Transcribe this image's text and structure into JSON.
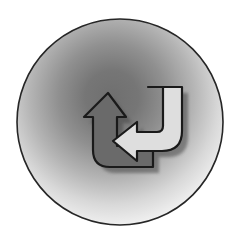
{
  "image": {
    "title": "Refresh / Swap Cycle Icon",
    "description": "A grayscale circular badge with a radial gradient background containing a two-arrow cyclical swap symbol.",
    "width": 242,
    "height": 246,
    "background_color": "#ffffff"
  },
  "badge": {
    "name": "circular-badge",
    "shape": "circle",
    "center_x": 120,
    "center_y": 122,
    "radius": 103,
    "outline_color": "#262626",
    "outline_width": 1.6,
    "gradient": {
      "type": "radial",
      "center_x_pct": 46,
      "center_y_pct": 38,
      "stops": [
        {
          "offset": "0%",
          "color": "#6f6f6f"
        },
        {
          "offset": "18%",
          "color": "#767676"
        },
        {
          "offset": "36%",
          "color": "#909090"
        },
        {
          "offset": "55%",
          "color": "#b4b4b4"
        },
        {
          "offset": "72%",
          "color": "#d8d8d8"
        },
        {
          "offset": "86%",
          "color": "#efefef"
        },
        {
          "offset": "100%",
          "color": "#fdfdfd"
        }
      ]
    }
  },
  "glyph": {
    "name": "swap-cycle-arrows",
    "semantic": "refresh",
    "outline_color": "#1a1a1a",
    "outline_width": 2.2,
    "shadow_color": "#4a4a4a",
    "shadow_offset_x": 6,
    "shadow_offset_y": 6,
    "arrows": [
      {
        "name": "left-up-arrow",
        "direction": "up",
        "fill_color": "#6a6a6a",
        "path": "M 108 93 L 126 117 L 117 117 L 117 146 L 153 146 L 153 167 L 110 167 Q 93 167 93 150 L 93 117 L 84 117 Z"
      },
      {
        "name": "right-down-arrow",
        "direction": "left",
        "fill_color": "#dedede",
        "path": "M 148 87 L 182 87 L 182 131 Q 182 151 162 151 L 137 151 L 137 161 L 113 141 L 137 122 L 137 132 L 157 132 Q 163 132 163 126 L 163 87 Z"
      }
    ]
  },
  "icon_names": [
    "refresh-icon",
    "swap-arrows-icon",
    "circular-badge-icon"
  ]
}
